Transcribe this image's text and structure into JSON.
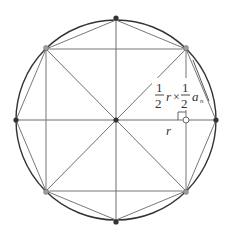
{
  "diagram": {
    "labels": {
      "frac_num_1": "1",
      "frac_den_1": "2",
      "r_1": "r",
      "times": "×",
      "frac_num_2": "1",
      "frac_den_2": "2",
      "a": "a",
      "n_sub": "n",
      "r_bottom": "r"
    },
    "colors": {
      "circle": "#333333",
      "lines": "#6e6e6e",
      "point_filled": "#333333",
      "point_gray": "#9a9a9a"
    },
    "geometry": {
      "center": [
        116,
        120
      ],
      "radius": 100
    }
  }
}
